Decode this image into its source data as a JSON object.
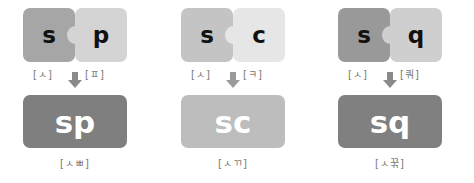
{
  "groups": [
    {
      "left": {
        "letter": "s",
        "label": "[ㅅ]",
        "color": "#a6a6a6"
      },
      "right": {
        "letter": "p",
        "label": "[ㅍ]",
        "color": "#d4d4d4"
      },
      "result": {
        "text": "sp",
        "label": "[ㅅㅃ]",
        "color": "#7f7f7f"
      }
    },
    {
      "left": {
        "letter": "s",
        "label": "[ㅅ]",
        "color": "#c4c4c4"
      },
      "right": {
        "letter": "c",
        "label": "[ㅋ]",
        "color": "#e6e6e6"
      },
      "result": {
        "text": "sc",
        "label": "[ㅅㄲ]",
        "color": "#bdbdbd"
      }
    },
    {
      "left": {
        "letter": "s",
        "label": "[ㅅ]",
        "color": "#999999"
      },
      "right": {
        "letter": "q",
        "label": "[쿼]",
        "color": "#cfcfcf"
      },
      "result": {
        "text": "sq",
        "label": "[ㅅ꾺]",
        "color": "#808080"
      }
    }
  ],
  "arrow_color": "#8a8a8a"
}
